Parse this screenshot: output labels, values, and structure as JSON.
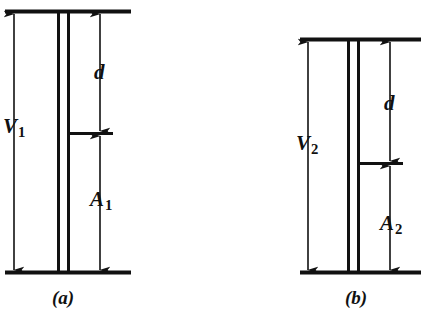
{
  "figure": {
    "type": "technical-line-diagram",
    "background_color": "#ffffff",
    "stroke_color": "#111111",
    "panels": [
      {
        "id": "a",
        "caption": "(a)",
        "labels": {
          "total_height": "V",
          "total_height_sub": "1",
          "upper_gap": "d",
          "lower_gap": "A",
          "lower_gap_sub": "1"
        },
        "geometry": {
          "top_rule_y": 11,
          "bottom_rule_y": 272,
          "rule_x_start": 5,
          "rule_x_end": 131,
          "tube_left_x": 58,
          "tube_right_x": 68,
          "tick_y": 133,
          "tick_x_start": 70,
          "tick_x_end": 113,
          "v_arrow_x": 14,
          "d_arrow_x": 100,
          "a_arrow_x": 100
        }
      },
      {
        "id": "b",
        "caption": "(b)",
        "labels": {
          "total_height": "V",
          "total_height_sub": "2",
          "upper_gap": "d",
          "lower_gap": "A",
          "lower_gap_sub": "2"
        },
        "geometry": {
          "top_rule_y": 39,
          "bottom_rule_y": 272,
          "rule_x_start": 300,
          "rule_x_end": 421,
          "tube_left_x": 348,
          "tube_right_x": 358,
          "tick_y": 163,
          "tick_x_start": 358,
          "tick_x_end": 403,
          "v_arrow_x": 308,
          "d_arrow_x": 390,
          "a_arrow_x": 390
        }
      }
    ]
  }
}
